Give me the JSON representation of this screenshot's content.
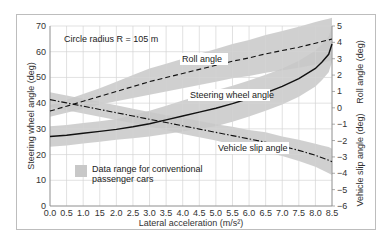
{
  "chart_data": {
    "type": "line",
    "title": "",
    "annotation": "Circle radius R = 105 m",
    "xlabel": "Lateral acceleration (m/s²)",
    "ylabel_left": "Steering wheel angle (deg)",
    "ylabel_right_upper": "Roll angle (deg)",
    "ylabel_right_lower": "Vehicle slip angle (deg)",
    "xlim": [
      0,
      8.5
    ],
    "ylim_left": [
      0,
      70
    ],
    "ylim_right": [
      -6,
      5
    ],
    "x_ticks": [
      "0.0",
      "0.5",
      "1.0",
      "15",
      "2.0",
      "2.5",
      "3.0",
      "3.5",
      "4.0",
      "4.5",
      "5.0",
      "5.5",
      "6.0",
      "6.5",
      "7.0",
      "7.5",
      "8.0",
      "8.5"
    ],
    "y_ticks_left": [
      "0",
      "10",
      "20",
      "30",
      "40",
      "50",
      "60",
      "70"
    ],
    "y_ticks_right": [
      "5",
      "4",
      "3",
      "2",
      "1",
      "0",
      "−1",
      "−2",
      "−3",
      "−4",
      "−5",
      "−6"
    ],
    "grid": true,
    "legend": {
      "label_line1": "Data range for conventional",
      "label_line2": "passenger cars",
      "color": "#c8c8c8"
    },
    "x": [
      0,
      0.5,
      1.0,
      1.5,
      2.0,
      2.5,
      3.0,
      3.5,
      4.0,
      4.5,
      5.0,
      5.5,
      6.0,
      6.5,
      7.0,
      7.5,
      8.0,
      8.2,
      8.4,
      8.5
    ],
    "series": [
      {
        "name": "Steering wheel angle",
        "axis": "left",
        "style": "solid",
        "values": [
          27,
          27.5,
          28.3,
          29,
          29.8,
          30.8,
          32,
          33.5,
          35,
          36.5,
          38,
          39.8,
          41.8,
          44,
          46.5,
          49.5,
          53.5,
          56,
          59,
          63
        ],
        "band": [
          4,
          4,
          4,
          4,
          4,
          4.5,
          5,
          5.5,
          6,
          6.5,
          7,
          7,
          7,
          7,
          7,
          7,
          7,
          7,
          7,
          7
        ]
      },
      {
        "name": "Roll angle",
        "axis": "right",
        "style": "dashed",
        "values": [
          -0.2,
          0.1,
          0.4,
          0.7,
          1.0,
          1.3,
          1.6,
          1.85,
          2.1,
          2.35,
          2.6,
          2.85,
          3.05,
          3.3,
          3.5,
          3.7,
          3.95,
          4.05,
          4.15,
          4.2
        ],
        "band": [
          0.35,
          0.4,
          0.45,
          0.5,
          0.6,
          0.7,
          0.8,
          0.85,
          0.9,
          0.95,
          1.0,
          1.05,
          1.1,
          1.15,
          1.2,
          1.25,
          1.3,
          1.3,
          1.3,
          1.3
        ]
      },
      {
        "name": "Vehicle slip angle",
        "axis": "right",
        "style": "dashdot",
        "values": [
          0.5,
          0.3,
          0.1,
          -0.1,
          -0.3,
          -0.5,
          -0.7,
          -0.9,
          -1.1,
          -1.3,
          -1.5,
          -1.7,
          -1.9,
          -2.1,
          -2.35,
          -2.6,
          -2.9,
          -3.05,
          -3.2,
          -3.3
        ],
        "band": [
          0.45,
          0.45,
          0.45,
          0.45,
          0.45,
          0.45,
          0.45,
          0.45,
          0.5,
          0.5,
          0.5,
          0.55,
          0.55,
          0.6,
          0.6,
          0.65,
          0.7,
          0.75,
          0.8,
          0.8
        ]
      }
    ],
    "labels": {
      "roll": "Roll angle",
      "steering": "Steering wheel angle",
      "slip": "Vehicle slip angle"
    }
  }
}
